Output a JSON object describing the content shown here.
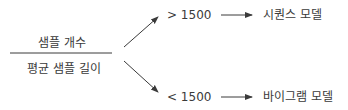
{
  "fraction": {
    "numerator": "샘플 개수",
    "denominator": "평균 샘플 길이"
  },
  "branches": [
    {
      "condition": "> 1500",
      "result": "시퀀스 모델"
    },
    {
      "condition": "< 1500",
      "result": "바이그램 모델"
    }
  ],
  "colors": {
    "line": "#3a3a3a",
    "text": "#3a3a3a"
  }
}
